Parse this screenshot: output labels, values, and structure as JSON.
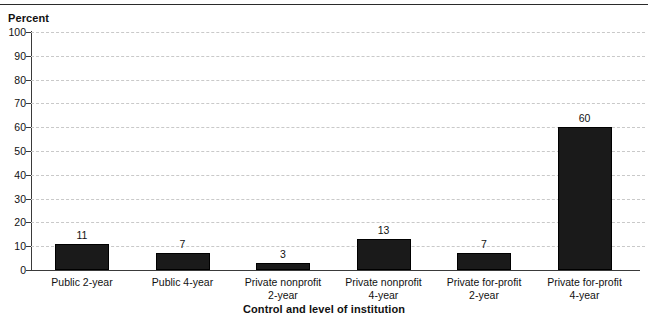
{
  "chart_data": {
    "type": "bar",
    "title": "",
    "subtitle": "",
    "xlabel": "Control and level of institution",
    "ylabel": "Percent",
    "ylim": [
      0,
      100
    ],
    "ytick_labels": [
      "100",
      "90",
      "80",
      "70",
      "60",
      "50",
      "40",
      "30",
      "20",
      "10",
      "0"
    ],
    "ytick_values": [
      100,
      90,
      80,
      70,
      60,
      50,
      40,
      30,
      20,
      10,
      0
    ],
    "grid": true,
    "legend": "none",
    "categories": [
      "Public 2-year",
      "Public 4-year",
      "Private nonprofit 2-year",
      "Private nonprofit 4-year",
      "Private for-profit 2-year",
      "Private for-profit 4-year"
    ],
    "category_lines": [
      [
        "Public 2-year",
        ""
      ],
      [
        "Public 4-year",
        ""
      ],
      [
        "Private nonprofit",
        "2-year"
      ],
      [
        "Private nonprofit",
        "4-year"
      ],
      [
        "Private for-profit",
        "2-year"
      ],
      [
        "Private for-profit",
        "4-year"
      ]
    ],
    "values": [
      11,
      7,
      3,
      13,
      7,
      60
    ],
    "value_labels": [
      "11",
      "7",
      "3",
      "13",
      "7",
      "60"
    ],
    "bar_color": "#1a1a1a",
    "gridline_color": "#c9c9c9",
    "axis_color": "#3a3a3a"
  }
}
